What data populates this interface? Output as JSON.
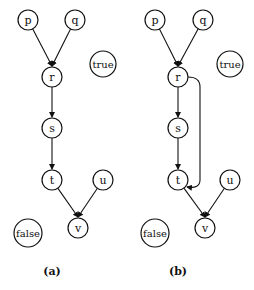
{
  "diagrams": [
    {
      "caption": "(a)",
      "nodes": [
        {
          "id": "p",
          "label": "p",
          "x": 28,
          "y": 20,
          "r": 10
        },
        {
          "id": "q",
          "label": "q",
          "x": 75,
          "y": 20,
          "r": 10
        },
        {
          "id": "r",
          "label": "r",
          "x": 52,
          "y": 77,
          "r": 10
        },
        {
          "id": "s",
          "label": "s",
          "x": 52,
          "y": 128,
          "r": 10
        },
        {
          "id": "t",
          "label": "t",
          "x": 52,
          "y": 180,
          "r": 10
        },
        {
          "id": "u",
          "label": "u",
          "x": 103,
          "y": 180,
          "r": 10
        },
        {
          "id": "v",
          "label": "v",
          "x": 78,
          "y": 228,
          "r": 10
        },
        {
          "id": "true",
          "label": "true",
          "x": 103,
          "y": 64,
          "r": 13
        },
        {
          "id": "false",
          "label": "false",
          "x": 28,
          "y": 233,
          "r": 14
        }
      ],
      "edges": [
        {
          "from": "p",
          "to": "r",
          "type": "join"
        },
        {
          "from": "q",
          "to": "r",
          "type": "join"
        },
        {
          "from": "r",
          "to": "s"
        },
        {
          "from": "s",
          "to": "t"
        },
        {
          "from": "t",
          "to": "v",
          "type": "join"
        },
        {
          "from": "u",
          "to": "v",
          "type": "join"
        }
      ]
    },
    {
      "caption": "(b)",
      "nodes": [
        {
          "id": "p",
          "label": "p",
          "x": 155,
          "y": 20,
          "r": 10
        },
        {
          "id": "q",
          "label": "q",
          "x": 203,
          "y": 20,
          "r": 10
        },
        {
          "id": "r",
          "label": "r",
          "x": 178,
          "y": 77,
          "r": 10
        },
        {
          "id": "s",
          "label": "s",
          "x": 178,
          "y": 128,
          "r": 10
        },
        {
          "id": "t",
          "label": "t",
          "x": 178,
          "y": 180,
          "r": 10
        },
        {
          "id": "u",
          "label": "u",
          "x": 230,
          "y": 180,
          "r": 10
        },
        {
          "id": "v",
          "label": "v",
          "x": 205,
          "y": 228,
          "r": 10
        },
        {
          "id": "true",
          "label": "true",
          "x": 230,
          "y": 64,
          "r": 13
        },
        {
          "id": "false",
          "label": "false",
          "x": 155,
          "y": 233,
          "r": 14
        }
      ],
      "edges": [
        {
          "from": "p",
          "to": "r",
          "type": "join"
        },
        {
          "from": "q",
          "to": "r",
          "type": "join"
        },
        {
          "from": "r",
          "to": "s"
        },
        {
          "from": "s",
          "to": "t"
        },
        {
          "from": "r",
          "to": "t",
          "type": "bypass"
        },
        {
          "from": "t",
          "to": "v",
          "type": "join"
        },
        {
          "from": "u",
          "to": "v",
          "type": "join"
        }
      ]
    }
  ],
  "colors": {
    "stroke": "#111111",
    "background": "#ffffff"
  }
}
